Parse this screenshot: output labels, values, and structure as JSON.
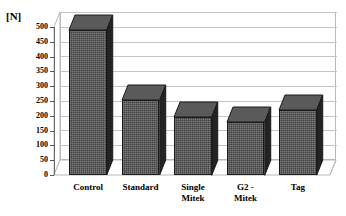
{
  "chart_data": {
    "type": "bar",
    "title": "",
    "subtitle": "",
    "xlabel": "",
    "ylabel": "[N]",
    "unit": "N",
    "categories": [
      "Control",
      "Standard",
      "Single Mitek",
      "G2 - Mitek",
      "Tag"
    ],
    "values": [
      490,
      253,
      197,
      180,
      220
    ],
    "ylim": [
      0,
      500
    ],
    "ytick_step": 50,
    "yticks": [
      0,
      50,
      100,
      150,
      200,
      250,
      300,
      350,
      400,
      450,
      500
    ],
    "ytick_labels": [
      "0",
      "50",
      "100",
      "150",
      "200",
      "250",
      "300",
      "350",
      "400",
      "450",
      "500"
    ],
    "grid": true,
    "grid_axis": "y",
    "legend": false,
    "legend_position": "none",
    "style": "3d-column",
    "series": [
      {
        "name": "Pull-out force",
        "values": [
          490,
          253,
          197,
          180,
          220
        ]
      }
    ],
    "colors": {
      "bar_front": "#434343",
      "bar_side": "#232323",
      "bar_top": "#5a5a5a",
      "bar_outline": "#1a1a1a",
      "gridline": "#c4c4c4",
      "axis": "#6b6b6b",
      "background": "#ffffff",
      "text": "#000000"
    },
    "bar_labels": [
      {
        "category": "Control",
        "lines": [
          "Control"
        ]
      },
      {
        "category": "Standard",
        "lines": [
          "Standard"
        ]
      },
      {
        "category": "Single Mitek",
        "lines": [
          "Single",
          "Mitek"
        ]
      },
      {
        "category": "G2 - Mitek",
        "lines": [
          "G2 -",
          "Mitek"
        ]
      },
      {
        "category": "Tag",
        "lines": [
          "Tag"
        ]
      }
    ]
  }
}
